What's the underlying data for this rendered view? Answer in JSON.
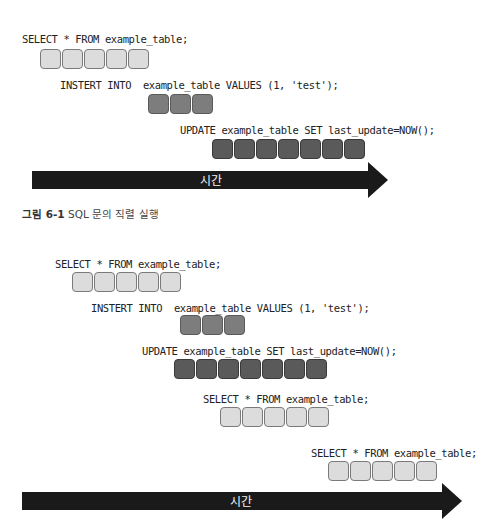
{
  "diagram1": {
    "queries": [
      {
        "label": "SELECT * FROM example_table;",
        "blocks": 5,
        "shade": "light"
      },
      {
        "label": "INSTERT INTO  example_table VALUES (1, 'test');",
        "blocks": 3,
        "shade": "mid"
      },
      {
        "label": "UPDATE example_table SET last_update=NOW();",
        "blocks": 7,
        "shade": "dark"
      }
    ],
    "arrow_label": "시간",
    "caption": {
      "number": "그림 6-1",
      "text": " SQL 문의 직렬 실행"
    }
  },
  "diagram2": {
    "queries": [
      {
        "label": "SELECT * FROM example_table;",
        "blocks": 5,
        "shade": "light"
      },
      {
        "label": "INSTERT INTO  example_table VALUES (1, 'test');",
        "blocks": 3,
        "shade": "mid"
      },
      {
        "label": "UPDATE example_table SET last_update=NOW();",
        "blocks": 7,
        "shade": "dark"
      },
      {
        "label": "SELECT * FROM example_table;",
        "blocks": 5,
        "shade": "light"
      },
      {
        "label": "SELECT * FROM example_table;",
        "blocks": 5,
        "shade": "light"
      }
    ],
    "arrow_label": "시간"
  },
  "colors": {
    "light_block": "#dcdcdc",
    "mid_block": "#7d7d7d",
    "dark_block": "#5a5a5a",
    "arrow": "#1a1a1a"
  }
}
